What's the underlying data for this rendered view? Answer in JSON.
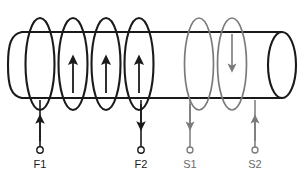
{
  "diagram": {
    "core": {
      "name": "cylindrical-core",
      "shape": "cylinder",
      "stroke_color": "#1a1a1a"
    },
    "colors": {
      "primary_winding": "#1a1a1a",
      "secondary_winding": "#7a7a7a",
      "core": "#1a1a1a",
      "background": "#ffffff"
    },
    "windings": [
      {
        "name": "field-winding",
        "color": "#1a1a1a",
        "loop_count": 4,
        "current_direction": "up"
      },
      {
        "name": "secondary-winding",
        "color": "#7a7a7a",
        "loop_count": 2,
        "current_direction": "down"
      }
    ],
    "terminals": [
      {
        "id": "F1",
        "label": "F1",
        "arrow": "up",
        "color": "#1a1a1a",
        "x": 40,
        "lead_top": 100,
        "lead_bottom": 147,
        "label_y": 168
      },
      {
        "id": "F2",
        "label": "F2",
        "arrow": "down",
        "color": "#1a1a1a",
        "x": 141,
        "lead_top": 100,
        "lead_bottom": 147,
        "label_y": 168
      },
      {
        "id": "S1",
        "label": "S1",
        "arrow": "down",
        "color": "#7a7a7a",
        "x": 190,
        "lead_top": 100,
        "lead_bottom": 147,
        "label_y": 168
      },
      {
        "id": "S2",
        "label": "S2",
        "arrow": "up",
        "color": "#7a7a7a",
        "x": 255,
        "lead_top": 100,
        "lead_bottom": 147,
        "label_y": 168
      }
    ]
  }
}
